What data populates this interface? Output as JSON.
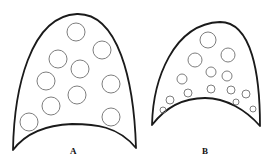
{
  "figure": {
    "panels": [
      {
        "label": "A",
        "description": "Dome shape with concave base containing evenly sized circles",
        "circles": [
          {
            "cx": 76,
            "cy": 32,
            "r": 9
          },
          {
            "cx": 102,
            "cy": 50,
            "r": 9
          },
          {
            "cx": 58,
            "cy": 59,
            "r": 9
          },
          {
            "cx": 80,
            "cy": 69,
            "r": 9
          },
          {
            "cx": 46,
            "cy": 81,
            "r": 9
          },
          {
            "cx": 111,
            "cy": 84,
            "r": 9
          },
          {
            "cx": 77,
            "cy": 95,
            "r": 9
          },
          {
            "cx": 51,
            "cy": 106,
            "r": 9
          },
          {
            "cx": 29,
            "cy": 122,
            "r": 9
          },
          {
            "cx": 111,
            "cy": 117,
            "r": 9
          }
        ]
      },
      {
        "label": "B",
        "description": "Smaller dome shape with circles decreasing in size toward the base",
        "circles": [
          {
            "cx": 208,
            "cy": 40,
            "r": 8
          },
          {
            "cx": 195,
            "cy": 60,
            "r": 7
          },
          {
            "cx": 228,
            "cy": 55,
            "r": 7
          },
          {
            "cx": 211,
            "cy": 72,
            "r": 5
          },
          {
            "cx": 227,
            "cy": 76,
            "r": 5
          },
          {
            "cx": 182,
            "cy": 79,
            "r": 5
          },
          {
            "cx": 188,
            "cy": 93,
            "r": 4
          },
          {
            "cx": 211,
            "cy": 89,
            "r": 4
          },
          {
            "cx": 231,
            "cy": 90,
            "r": 4
          },
          {
            "cx": 246,
            "cy": 94,
            "r": 4
          },
          {
            "cx": 170,
            "cy": 100,
            "r": 4
          },
          {
            "cx": 236,
            "cy": 102,
            "r": 3
          },
          {
            "cx": 163,
            "cy": 110,
            "r": 3
          },
          {
            "cx": 253,
            "cy": 109,
            "r": 3
          }
        ]
      }
    ]
  }
}
